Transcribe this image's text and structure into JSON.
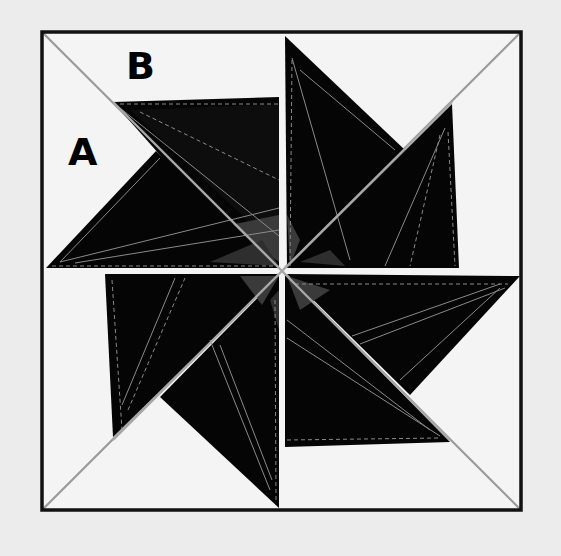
{
  "diagram": {
    "type": "quilt-block-pinwheel-star",
    "background_color": "#ececec",
    "block_fill": "#f4f4f4",
    "frame_color": "#111111",
    "blade_color": "#050505",
    "inner_seam_color": "#9a9a9a",
    "center_facet_color": "#3a3a3a",
    "labels": [
      {
        "id": "A",
        "text": "A"
      },
      {
        "id": "B",
        "text": "B"
      }
    ],
    "frame": {
      "left": 41,
      "top": 31,
      "right": 522,
      "bottom": 511
    },
    "center": {
      "x": 283,
      "y": 270
    },
    "blades": [
      {
        "name": "blade-B-upper-left-horizontal",
        "points": "113,102 279,97 279,266 205,266"
      },
      {
        "name": "blade-A-upper-left-diagonal",
        "points": "46,268 156,151 279,266"
      },
      {
        "name": "blade-upper-right-vertical",
        "points": "285,36 405,150 287,266"
      },
      {
        "name": "blade-upper-right-diagonal",
        "points": "452,104 459,270 287,268"
      },
      {
        "name": "blade-lower-right-horizontal",
        "points": "520,277 410,395 287,274"
      },
      {
        "name": "blade-lower-right-diagonal",
        "points": "450,442 285,447 285,274"
      },
      {
        "name": "blade-lower-left-vertical",
        "points": "279,508 160,397 279,276"
      },
      {
        "name": "blade-lower-left-diagonal",
        "points": "105,274 279,274 113,437"
      }
    ]
  }
}
